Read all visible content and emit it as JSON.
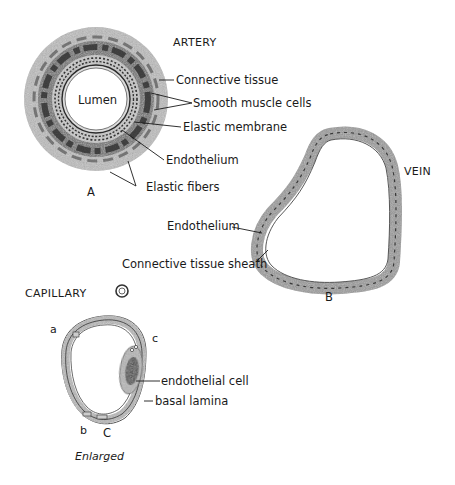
{
  "artery": {
    "title": "ARTERY",
    "letter": "A",
    "lumen": "Lumen",
    "labels": {
      "connective_tissue": "Connective tissue",
      "smooth_muscle": "Smooth muscle cells",
      "elastic_membrane": "Elastic membrane",
      "endothelium": "Endothelium",
      "elastic_fibers": "Elastic fibers"
    }
  },
  "vein": {
    "title": "VEIN",
    "letter": "B",
    "labels": {
      "endothelium": "Endothelium",
      "connective_sheath": "Connective tissue sheath"
    }
  },
  "capillary": {
    "title": "CAPILLARY",
    "letter": "C",
    "caption": "Enlarged",
    "markers": {
      "a": "a",
      "b": "b",
      "c": "c"
    },
    "labels": {
      "endothelial_cell": "endothelial cell",
      "basal_lamina": "basal lamina"
    }
  },
  "colors": {
    "tissue_light": "#c4c4c4",
    "tissue_mid": "#8a8a8a",
    "tissue_dark": "#2e2e2e",
    "ink": "#1a1a1a",
    "background": "#ffffff"
  }
}
